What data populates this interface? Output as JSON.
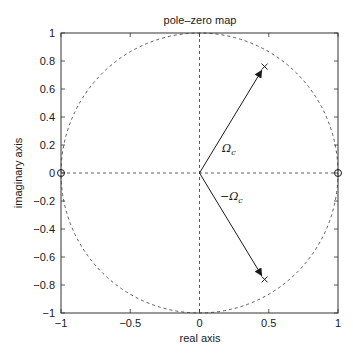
{
  "chart_data": {
    "type": "scatter",
    "subtype": "pole-zero map",
    "title": "pole–zero map",
    "xlabel": "real axis",
    "ylabel": "imaginary axis",
    "xlim": [
      -1,
      1
    ],
    "ylim": [
      -1,
      1
    ],
    "xticks": [
      -1,
      -0.5,
      0,
      0.5,
      1
    ],
    "xtick_labels": [
      "−1",
      "−0.5",
      "0",
      "0.5",
      "1"
    ],
    "yticks": [
      1,
      0.8,
      0.6,
      0.4,
      0.2,
      0,
      -0.2,
      -0.4,
      -0.6,
      -0.8,
      -1
    ],
    "ytick_labels": [
      "1",
      "0.8",
      "0.6",
      "0.4",
      "0.2",
      "0",
      "−0.2",
      "−0.4",
      "−0.6",
      "−0.8",
      "−1"
    ],
    "grid": false,
    "unit_circle": true,
    "dashed_axes": true,
    "series": [
      {
        "name": "poles",
        "marker": "x",
        "points": [
          [
            0.47,
            0.76
          ],
          [
            0.47,
            -0.76
          ]
        ]
      },
      {
        "name": "zeros",
        "marker": "o",
        "points": [
          [
            -1,
            0
          ],
          [
            1,
            0
          ]
        ]
      }
    ],
    "annotations": [
      {
        "type": "arrow",
        "from": [
          0,
          0
        ],
        "to": [
          0.47,
          0.76
        ],
        "label": "Ωc",
        "label_pos": [
          0.12,
          0.28
        ]
      },
      {
        "type": "arrow",
        "from": [
          0,
          0
        ],
        "to": [
          0.47,
          -0.76
        ],
        "label": "−Ωc",
        "label_pos": [
          0.1,
          -0.17
        ]
      }
    ]
  },
  "labels": {
    "title": "pole–zero map",
    "xlabel": "real axis",
    "ylabel": "imaginary axis",
    "omega_pos": "Ω",
    "omega_neg": "−Ω",
    "sub_c": "c"
  }
}
